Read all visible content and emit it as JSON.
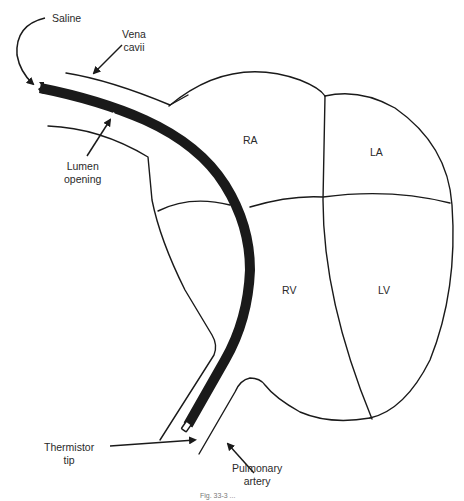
{
  "diagram": {
    "type": "anatomical illustration",
    "colors": {
      "line": "#1a1a1a",
      "catheter": "#1a1a1a",
      "text": "#2a2a2a",
      "background": "#ffffff"
    },
    "chambers": {
      "ra": "RA",
      "la": "LA",
      "rv": "RV",
      "lv": "LV"
    },
    "annotations": {
      "saline": "Saline",
      "vena_cavii_line1": "Vena",
      "vena_cavii_line2": "cavii",
      "lumen_line1": "Lumen",
      "lumen_line2": "opening",
      "thermistor_line1": "Thermistor",
      "thermistor_line2": "tip",
      "pulmonary_line1": "Pulmonary",
      "pulmonary_line2": "artery"
    },
    "caption": "Fig. 33-3 ..."
  }
}
